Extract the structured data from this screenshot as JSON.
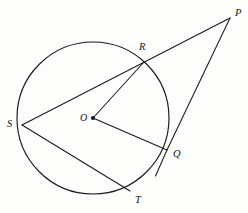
{
  "figure": {
    "background_color": "#fdfdfc",
    "stroke_color": "#1a1a1a",
    "width": 248,
    "height": 213
  },
  "circle": {
    "center_label": "O",
    "center_x": 93,
    "center_y": 118,
    "radius": 76
  },
  "points": [
    {
      "id": "P",
      "label": "P",
      "x": 230,
      "y": 18,
      "label_x": 235,
      "label_y": 8,
      "on_circle": false,
      "note": "external point"
    },
    {
      "id": "R",
      "label": "R",
      "x": 144,
      "y": 62,
      "label_x": 139,
      "label_y": 42,
      "on_circle": true,
      "note": "secant meets circle"
    },
    {
      "id": "Q",
      "label": "Q",
      "x": 167,
      "y": 150,
      "label_x": 173,
      "label_y": 149,
      "on_circle": true,
      "note": "point of tangency"
    },
    {
      "id": "S",
      "label": "S",
      "x": 22,
      "y": 125,
      "label_x": 7,
      "label_y": 119,
      "on_circle": true,
      "note": "left of circle"
    },
    {
      "id": "T",
      "label": "T",
      "x": 130,
      "y": 191,
      "label_x": 135,
      "label_y": 195,
      "on_circle": true,
      "note": "bottom of circle"
    },
    {
      "id": "O",
      "label": "O",
      "x": 93,
      "y": 118,
      "label_x": 80,
      "label_y": 113,
      "on_circle": false,
      "note": "center"
    }
  ],
  "segments": [
    {
      "id": "SP",
      "name": "secant-s-to-p",
      "from": "S",
      "to": "P",
      "path": "M 22 125 L 230 18"
    },
    {
      "id": "PQ",
      "name": "tangent-p-to-q",
      "from": "P",
      "to": "Q",
      "path": "M 230 18 L 167 150"
    },
    {
      "id": "QX",
      "name": "tangent-extension",
      "from": "Q",
      "to": "X",
      "path": "M 167 150 L 155 176"
    },
    {
      "id": "OR",
      "name": "radius-o-to-r",
      "from": "O",
      "to": "R",
      "path": "M 93 118 L 144 62"
    },
    {
      "id": "OQ",
      "name": "radius-o-to-q",
      "from": "O",
      "to": "Q",
      "path": "M 93 118 L 167 150"
    },
    {
      "id": "ST",
      "name": "chord-s-to-t",
      "from": "S",
      "to": "T",
      "path": "M 22 125 L 130 191"
    }
  ],
  "labels": {
    "P": "P",
    "R": "R",
    "Q": "Q",
    "S": "S",
    "T": "T",
    "O": "O"
  }
}
